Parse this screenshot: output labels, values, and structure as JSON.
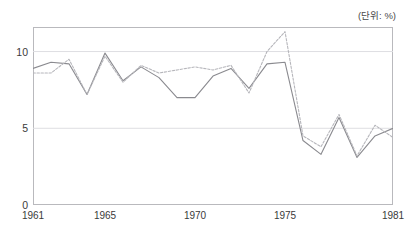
{
  "chart_data": {
    "type": "line",
    "title": "",
    "unit_label": "(단위: %)",
    "xlabel": "",
    "ylabel": "",
    "xlim": [
      1961,
      1981
    ],
    "ylim": [
      0,
      11.6
    ],
    "grid": true,
    "legend_position": "none",
    "y_ticks": [
      0,
      5,
      10
    ],
    "y_tick_labels": [
      "0",
      "5",
      "10"
    ],
    "x_ticks": [
      1961,
      1965,
      1970,
      1975,
      1981
    ],
    "x_tick_labels": [
      "1961",
      "1965",
      "1970",
      "1975",
      "1981"
    ],
    "x": [
      1961,
      1962,
      1963,
      1964,
      1965,
      1966,
      1967,
      1968,
      1969,
      1970,
      1971,
      1972,
      1973,
      1974,
      1975,
      1976,
      1977,
      1978,
      1979,
      1980,
      1981
    ],
    "series": [
      {
        "name": "series-solid",
        "style": "solid",
        "color": "#8a8a8f",
        "values": [
          8.9,
          9.3,
          9.2,
          7.2,
          9.9,
          8.1,
          9.0,
          8.3,
          7.0,
          7.0,
          8.4,
          8.9,
          7.6,
          9.2,
          9.3,
          4.2,
          3.3,
          5.7,
          3.1,
          4.5,
          5.0
        ]
      },
      {
        "name": "series-dotted",
        "style": "dotted",
        "color": "#b6b6bb",
        "values": [
          8.6,
          8.6,
          9.5,
          7.2,
          9.7,
          8.0,
          9.1,
          8.6,
          8.8,
          9.0,
          8.8,
          9.1,
          7.3,
          10.0,
          11.3,
          4.5,
          3.8,
          5.9,
          3.2,
          5.2,
          4.4
        ]
      }
    ],
    "colors": {
      "frame": "#b9b9bd",
      "grid": "#dedee2",
      "text": "#3a3a3a",
      "background": "#ffffff"
    }
  }
}
